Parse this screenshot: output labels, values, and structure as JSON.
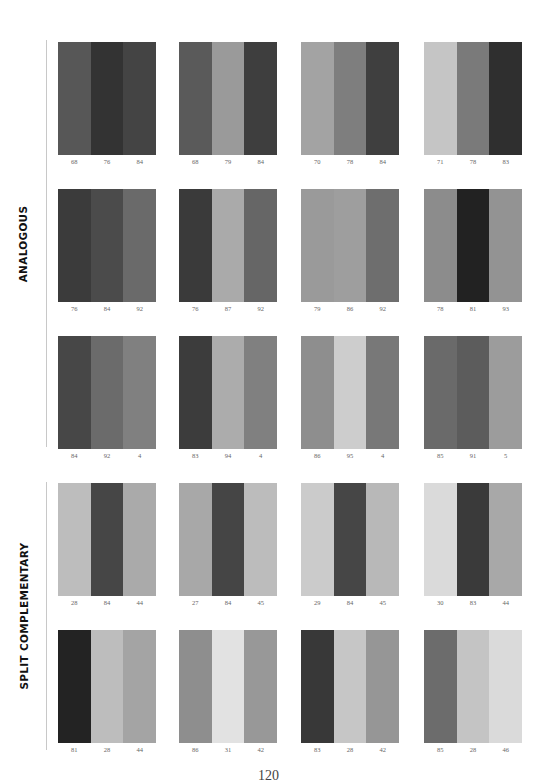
{
  "sections": [
    {
      "label": "ANALOGOUS",
      "rows": [
        [
          {
            "values": [
              "68",
              "76",
              "84"
            ],
            "colors": [
              "#575757",
              "#333333",
              "#444444"
            ]
          },
          {
            "values": [
              "68",
              "79",
              "84"
            ],
            "colors": [
              "#5a5a5a",
              "#9a9a9a",
              "#3e3e3e"
            ]
          },
          {
            "values": [
              "70",
              "78",
              "84"
            ],
            "colors": [
              "#a3a3a3",
              "#7e7e7e",
              "#3f3f3f"
            ]
          },
          {
            "values": [
              "71",
              "78",
              "83"
            ],
            "colors": [
              "#c5c5c5",
              "#7a7a7a",
              "#2f2f2f"
            ]
          }
        ],
        [
          {
            "values": [
              "76",
              "84",
              "92"
            ],
            "colors": [
              "#3b3b3b",
              "#4b4b4b",
              "#6a6a6a"
            ]
          },
          {
            "values": [
              "76",
              "87",
              "92"
            ],
            "colors": [
              "#3a3a3a",
              "#aaaaaa",
              "#666666"
            ]
          },
          {
            "values": [
              "79",
              "86",
              "92"
            ],
            "colors": [
              "#9a9a9a",
              "#9e9e9e",
              "#6e6e6e"
            ]
          },
          {
            "values": [
              "78",
              "81",
              "93"
            ],
            "colors": [
              "#8c8c8c",
              "#222222",
              "#939393"
            ]
          }
        ],
        [
          {
            "values": [
              "84",
              "92",
              "4"
            ],
            "colors": [
              "#474747",
              "#6b6b6b",
              "#808080"
            ]
          },
          {
            "values": [
              "83",
              "94",
              "4"
            ],
            "colors": [
              "#3c3c3c",
              "#acacac",
              "#808080"
            ]
          },
          {
            "values": [
              "86",
              "95",
              "4"
            ],
            "colors": [
              "#8e8e8e",
              "#cdcdcd",
              "#787878"
            ]
          },
          {
            "values": [
              "85",
              "91",
              "5"
            ],
            "colors": [
              "#6a6a6a",
              "#5c5c5c",
              "#9c9c9c"
            ]
          }
        ]
      ]
    },
    {
      "label": "SPLIT COMPLEMENTARY",
      "rows": [
        [
          {
            "values": [
              "28",
              "84",
              "44"
            ],
            "colors": [
              "#bdbdbd",
              "#464646",
              "#aaaaaa"
            ]
          },
          {
            "values": [
              "27",
              "84",
              "45"
            ],
            "colors": [
              "#a8a8a8",
              "#454545",
              "#bcbcbc"
            ]
          },
          {
            "values": [
              "29",
              "84",
              "45"
            ],
            "colors": [
              "#cbcbcb",
              "#464646",
              "#b8b8b8"
            ]
          },
          {
            "values": [
              "30",
              "83",
              "44"
            ],
            "colors": [
              "#dadada",
              "#3a3a3a",
              "#a8a8a8"
            ]
          }
        ],
        [
          {
            "values": [
              "81",
              "28",
              "44"
            ],
            "colors": [
              "#232323",
              "#bdbdbd",
              "#a4a4a4"
            ]
          },
          {
            "values": [
              "86",
              "31",
              "42"
            ],
            "colors": [
              "#8e8e8e",
              "#e2e2e2",
              "#989898"
            ]
          },
          {
            "values": [
              "83",
              "28",
              "42"
            ],
            "colors": [
              "#383838",
              "#c6c6c6",
              "#969696"
            ]
          },
          {
            "values": [
              "85",
              "28",
              "46"
            ],
            "colors": [
              "#6c6c6c",
              "#c4c4c4",
              "#dadada"
            ]
          }
        ]
      ]
    }
  ],
  "page_number": "120"
}
